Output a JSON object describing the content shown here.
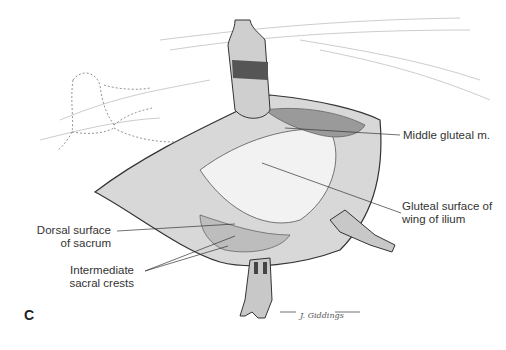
{
  "figure": {
    "panel_letter": "C",
    "signature": "J. Giddings",
    "labels": [
      {
        "id": "middle-gluteal",
        "text": "Middle gluteal m."
      },
      {
        "id": "gluteal-surface-1",
        "text": "Gluteal surface of"
      },
      {
        "id": "gluteal-surface-2",
        "text": "wing of ilium"
      },
      {
        "id": "dorsal-surface-1",
        "text": "Dorsal surface"
      },
      {
        "id": "dorsal-surface-2",
        "text": "of sacrum"
      },
      {
        "id": "intermediate-1",
        "text": "Intermediate"
      },
      {
        "id": "intermediate-2",
        "text": "sacral crests"
      }
    ],
    "colors": {
      "ink": "#333333",
      "shade": "#888888",
      "background": "#ffffff"
    }
  }
}
